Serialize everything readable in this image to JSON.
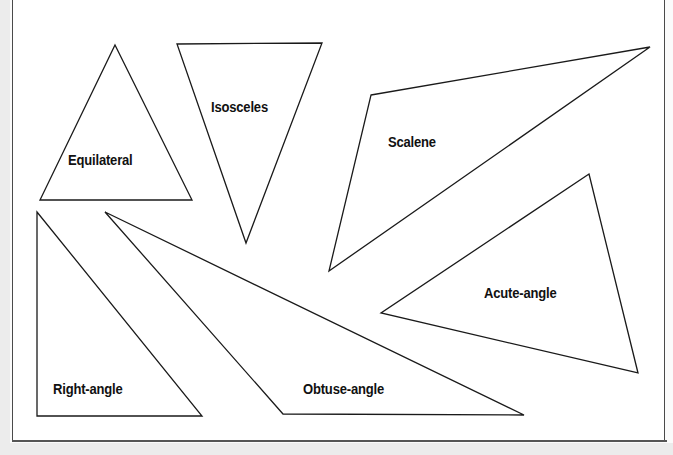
{
  "figure": {
    "background_color": "#ffffff",
    "stroke_color": "#1a1a1a",
    "label_color": "#111111",
    "frame_color": "#4a4a4a"
  },
  "shapes": [
    {
      "id": "equilateral",
      "label": "Equilateral",
      "points": "115,45 192,200 40,200",
      "label_x": 68,
      "label_y": 152
    },
    {
      "id": "isosceles",
      "label": "Isosceles",
      "points": "177,44 322,43 246,243",
      "label_x": 211,
      "label_y": 99
    },
    {
      "id": "scalene",
      "label": "Scalene",
      "points": "371,95 650,47 329,271",
      "label_x": 388,
      "label_y": 134
    },
    {
      "id": "acute-angle",
      "label": "Acute-angle",
      "points": "589,174 638,373 381,313",
      "label_x": 484,
      "label_y": 285
    },
    {
      "id": "right-angle",
      "label": "Right-angle",
      "points": "37,212 202,416 37,416",
      "label_x": 53,
      "label_y": 381
    },
    {
      "id": "obtuse-angle",
      "label": "Obtuse-angle",
      "points": "105,212 524,415 283,414",
      "label_x": 303,
      "label_y": 381
    }
  ]
}
